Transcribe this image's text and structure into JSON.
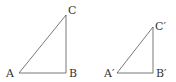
{
  "diagram": {
    "type": "similar-right-triangles",
    "triangles": [
      {
        "name": "triangle-ABC",
        "vertices": [
          {
            "label": "A",
            "x": 19,
            "y": 73,
            "lx": 6,
            "ly": 77
          },
          {
            "label": "B",
            "x": 66,
            "y": 73,
            "lx": 69,
            "ly": 77
          },
          {
            "label": "C",
            "x": 66,
            "y": 15,
            "lx": 68,
            "ly": 14
          }
        ]
      },
      {
        "name": "triangle-A'B'C'",
        "vertices": [
          {
            "label": "A′",
            "x": 117,
            "y": 73,
            "lx": 104,
            "ly": 77
          },
          {
            "label": "B′",
            "x": 153,
            "y": 73,
            "lx": 156,
            "ly": 77
          },
          {
            "label": "C′",
            "x": 153,
            "y": 27,
            "lx": 155,
            "ly": 30
          }
        ]
      }
    ],
    "stroke_color": "#555555"
  }
}
